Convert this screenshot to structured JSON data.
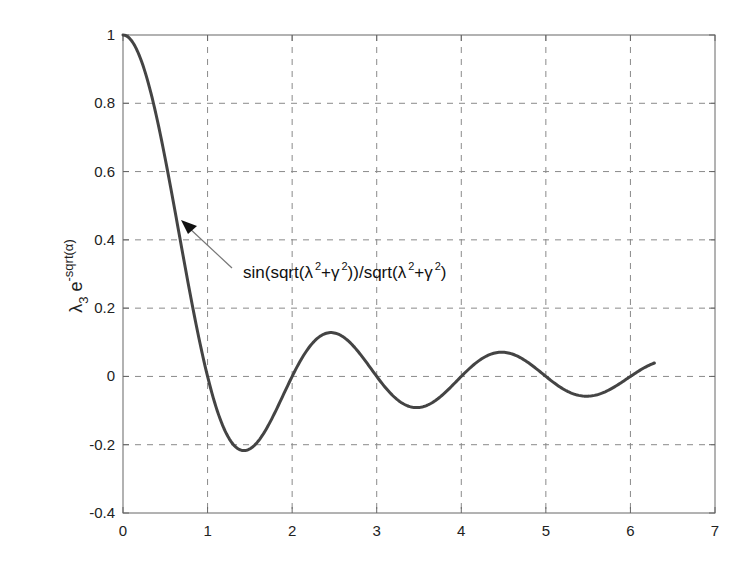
{
  "chart_data": {
    "type": "line",
    "title": "",
    "xlabel": "",
    "ylabel": "λ3 e^-sqrt(α)",
    "ylabel_parts": {
      "base": "λ",
      "sub": "3",
      "e": " e",
      "sup": "-sqrt(α)"
    },
    "xlim": [
      0,
      7
    ],
    "ylim": [
      -0.4,
      1
    ],
    "grid": true,
    "legend": null,
    "x_ticks": [
      "0",
      "1",
      "2",
      "3",
      "4",
      "5",
      "6",
      "7"
    ],
    "y_ticks": [
      "-0.4",
      "-0.2",
      "0",
      "0.2",
      "0.4",
      "0.6",
      "0.8",
      "1"
    ],
    "series": [
      {
        "name": "sin(sqrt(λ²+γ²))/sqrt(λ²+γ²)",
        "function": "sin(pi*x)/(pi*x)",
        "x_range": [
          0,
          6.2832
        ],
        "color": "#444444",
        "key_points": [
          {
            "x": 0,
            "y": 1.0
          },
          {
            "x": 0.5,
            "y": 0.637
          },
          {
            "x": 1.0,
            "y": 0.0
          },
          {
            "x": 1.43,
            "y": -0.217
          },
          {
            "x": 2.0,
            "y": 0.0
          },
          {
            "x": 2.46,
            "y": 0.128
          },
          {
            "x": 3.0,
            "y": 0.0
          },
          {
            "x": 3.47,
            "y": -0.091
          },
          {
            "x": 4.0,
            "y": 0.0
          },
          {
            "x": 4.48,
            "y": 0.071
          },
          {
            "x": 5.0,
            "y": 0.0
          },
          {
            "x": 5.48,
            "y": -0.058
          },
          {
            "x": 6.0,
            "y": 0.0
          },
          {
            "x": 6.28,
            "y": 0.045
          }
        ]
      }
    ],
    "annotations": [
      {
        "text_parts": [
          "sin(sqrt(λ",
          "2",
          "+γ",
          "2",
          "))/sqrt(λ",
          "2",
          "+γ",
          "2",
          ")"
        ],
        "arrow_tip": {
          "x": 0.68,
          "y": 0.46
        },
        "text_anchor": {
          "x": 1.41,
          "y": 0.31
        }
      }
    ]
  },
  "colors": {
    "line": "#444444",
    "grid": "#8a8a8a",
    "axes": "#666666",
    "text": "#222222"
  }
}
